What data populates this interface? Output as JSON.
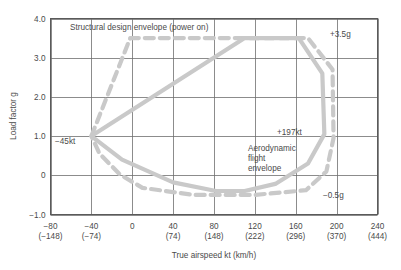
{
  "chart_data": {
    "type": "line",
    "title": "",
    "xlabel": "True airspeed kt (km/h)",
    "ylabel": "Load factor g",
    "xlim": [
      -80,
      240
    ],
    "ylim": [
      -1.0,
      4.0
    ],
    "grid": true,
    "legend": "none",
    "x_ticks": [
      {
        "primary": "−80",
        "secondary": "(−148)",
        "value": -80
      },
      {
        "primary": "−40",
        "secondary": "(−74)",
        "value": -40
      },
      {
        "primary": "0",
        "secondary": "",
        "value": 0
      },
      {
        "primary": "40",
        "secondary": "(74)",
        "value": 40
      },
      {
        "primary": "80",
        "secondary": "(148)",
        "value": 80
      },
      {
        "primary": "120",
        "secondary": "(222)",
        "value": 120
      },
      {
        "primary": "160",
        "secondary": "(296)",
        "value": 160
      },
      {
        "primary": "200",
        "secondary": "(370)",
        "value": 200
      },
      {
        "primary": "240",
        "secondary": "(444)",
        "value": 240
      }
    ],
    "y_ticks": [
      {
        "label": "4.0",
        "value": 4.0
      },
      {
        "label": "3.0",
        "value": 3.0
      },
      {
        "label": "2.0",
        "value": 2.0
      },
      {
        "label": "1.0",
        "value": 1.0
      },
      {
        "label": "0",
        "value": 0
      },
      {
        "label": "−1.0",
        "value": -1.0
      }
    ],
    "series": [
      {
        "name": "Structural design envelope (power on)",
        "style": "dashed",
        "color": "#c9c9c9",
        "closed": true,
        "points": [
          [
            -40,
            1.0
          ],
          [
            -2,
            3.5
          ],
          [
            172,
            3.5
          ],
          [
            196,
            2.7
          ],
          [
            197,
            0.95
          ],
          [
            190,
            0.1
          ],
          [
            170,
            -0.38
          ],
          [
            120,
            -0.5
          ],
          [
            60,
            -0.5
          ],
          [
            10,
            -0.32
          ],
          [
            -12,
            0.02
          ],
          [
            -32,
            0.55
          ],
          [
            -40,
            1.0
          ]
        ]
      },
      {
        "name": "Aerodynamic flight envelope",
        "style": "solid",
        "color": "#c9c9c9",
        "closed": true,
        "points": [
          [
            -40,
            1.0
          ],
          [
            110,
            3.5
          ],
          [
            163,
            3.5
          ],
          [
            186,
            2.6
          ],
          [
            188,
            1.05
          ],
          [
            172,
            0.3
          ],
          [
            140,
            -0.22
          ],
          [
            110,
            -0.4
          ],
          [
            82,
            -0.4
          ],
          [
            40,
            -0.18
          ],
          [
            -10,
            0.4
          ],
          [
            -40,
            1.0
          ]
        ]
      }
    ],
    "annotations": [
      {
        "id": "structural-label",
        "text": "Structural design envelope (power on)",
        "x": 70,
        "y": 30,
        "anchor": "start"
      },
      {
        "id": "plus-3-5-g",
        "text": "+3.5g",
        "x": 330,
        "y": 37,
        "anchor": "start"
      },
      {
        "id": "plus-197-kt",
        "text": "+197kt",
        "x": 277,
        "y": 135,
        "anchor": "start"
      },
      {
        "id": "minus-45-kt",
        "text": "−45kt",
        "x": 55,
        "y": 144,
        "anchor": "start"
      },
      {
        "id": "minus-0-5-g",
        "text": "−0.5g",
        "x": 323,
        "y": 198,
        "anchor": "start"
      },
      {
        "id": "aerodynamic-line-1",
        "text": "Aerodynamic",
        "x": 248,
        "y": 151,
        "anchor": "start"
      },
      {
        "id": "aerodynamic-line-2",
        "text": "flight",
        "x": 248,
        "y": 161,
        "anchor": "start"
      },
      {
        "id": "aerodynamic-line-3",
        "text": "envelope",
        "x": 248,
        "y": 171,
        "anchor": "start"
      }
    ],
    "colors": {
      "curve": "#c9c9c9",
      "grid": "#6f6f6f",
      "frame": "#5a5a5a",
      "text": "#4a4a4a",
      "background": "#ffffff"
    }
  }
}
